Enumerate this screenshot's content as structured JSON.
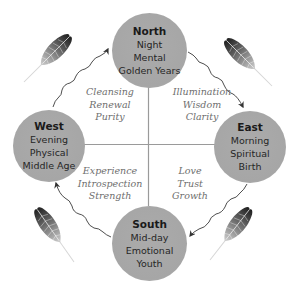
{
  "colors": {
    "circle_fill": "#a8a8a8",
    "circle_text": "#262626",
    "quadrant_text": "#6e6e6e",
    "cross_lines": "#9a9a9a",
    "arrows": "#3a3a3a",
    "feather_dark": "#2a2a2a"
  },
  "directions": {
    "north": {
      "title": "North",
      "lines": [
        "Night",
        "Mental",
        "Golden Years"
      ]
    },
    "east": {
      "title": "East",
      "lines": [
        "Morning",
        "Spiritual",
        "Birth"
      ]
    },
    "south": {
      "title": "South",
      "lines": [
        "Mid-day",
        "Emotional",
        "Youth"
      ]
    },
    "west": {
      "title": "West",
      "lines": [
        "Evening",
        "Physical",
        "Middle Age"
      ]
    }
  },
  "quadrants": {
    "north_west": [
      "Cleansing",
      "Renewal",
      "Purity"
    ],
    "north_east": [
      "Illumination",
      "Wisdom",
      "Clarity"
    ],
    "south_west": [
      "Experience",
      "Introspection",
      "Strength"
    ],
    "south_east": [
      "Love",
      "Trust",
      "Growth"
    ]
  },
  "flow": [
    "West → North",
    "North → East",
    "East → South",
    "South → West"
  ],
  "decorations": [
    "feather-icon top-left",
    "feather-icon top-right",
    "feather-icon bottom-left",
    "feather-icon bottom-right"
  ]
}
